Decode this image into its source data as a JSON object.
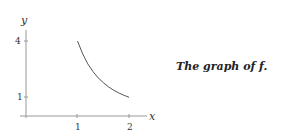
{
  "caption": {
    "prefix": "The graph of",
    "func": "f",
    "suffix": "."
  },
  "chart_data": {
    "type": "line",
    "title": "",
    "xlabel": "x",
    "ylabel": "y",
    "xticks": [
      "1",
      "2"
    ],
    "yticks": [
      "1",
      "4"
    ],
    "xlim": [
      0,
      2.5
    ],
    "ylim": [
      0,
      4.5
    ],
    "grid": false,
    "series": [
      {
        "name": "f",
        "x": [
          1.0,
          1.1,
          1.2,
          1.3,
          1.4,
          1.5,
          1.6,
          1.7,
          1.8,
          1.9,
          2.0
        ],
        "y": [
          4.0,
          3.31,
          2.78,
          2.37,
          2.04,
          1.78,
          1.56,
          1.38,
          1.23,
          1.11,
          1.0
        ]
      }
    ]
  }
}
